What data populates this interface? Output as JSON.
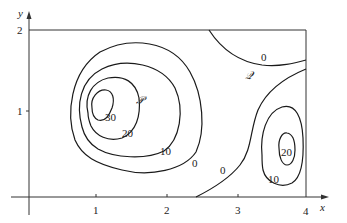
{
  "diagram": {
    "type": "contour-map",
    "axes": {
      "x_label": "x",
      "y_label": "y",
      "x_ticks": [
        "1",
        "2",
        "3",
        "4"
      ],
      "y_ticks": [
        "1",
        "2"
      ]
    },
    "points": {
      "P": "𝒫",
      "Q": "𝒬"
    },
    "contour_labels": {
      "left_30": "30",
      "left_20": "20",
      "left_10": "10",
      "left_0": "0",
      "middle_0": "0",
      "top_0": "0",
      "right_20": "20",
      "right_10": "10"
    },
    "colors": {
      "line": "#1a1a1a",
      "background": "#ffffff"
    }
  }
}
